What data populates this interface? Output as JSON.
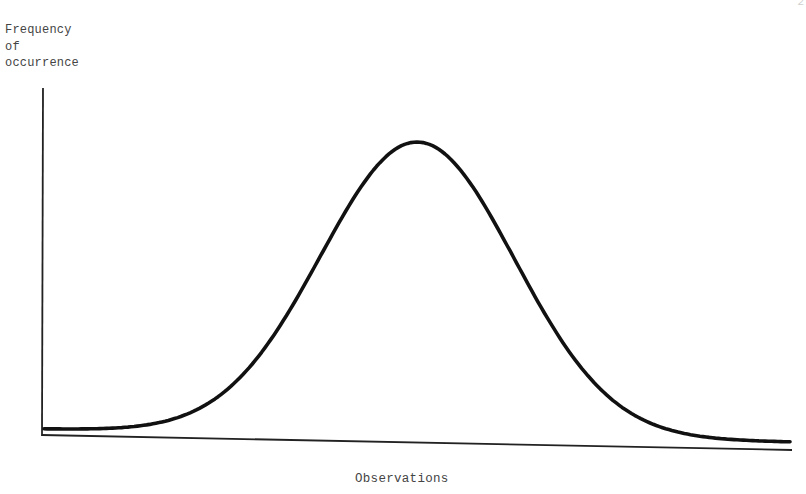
{
  "page": {
    "page_number_fragment": "2"
  },
  "chart_data": {
    "type": "line",
    "title": "",
    "xlabel": "Observations",
    "ylabel": "Frequency of occurrence",
    "ylabel_lines": [
      "Frequency",
      "of",
      "occurrence"
    ],
    "x_ticks": [],
    "y_ticks": [],
    "grid": false,
    "legend": null,
    "series": [
      {
        "name": "Normal distribution",
        "distribution": "normal",
        "mean": 0.5,
        "std_dev": 0.13,
        "x_range": [
          0,
          1
        ],
        "peak_relative_height": 1.0,
        "baseline_relative_height": 0.02
      }
    ],
    "colors": {
      "curve": "#111111",
      "axes": "#222222",
      "text": "#444444"
    }
  }
}
